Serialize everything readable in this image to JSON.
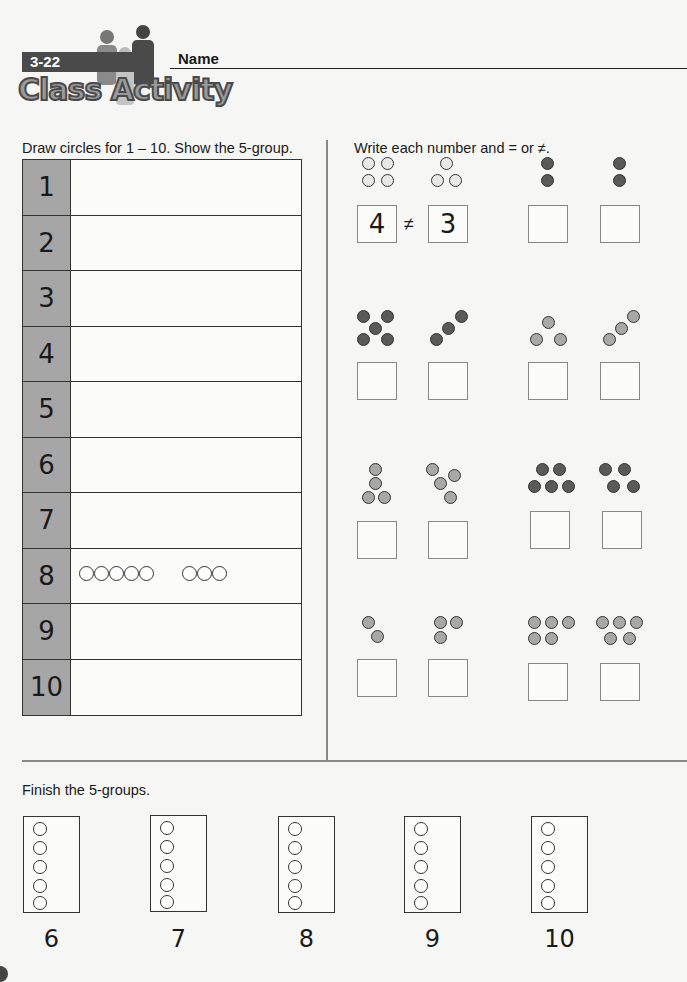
{
  "header": {
    "lesson_number": "3-22",
    "banner_title": "Class Activity",
    "name_label": "Name"
  },
  "left_section": {
    "instruction": "Draw circles for 1 – 10. Show the 5-group.",
    "rows": [
      {
        "number": "1",
        "circles_first": 0,
        "circles_second": 0
      },
      {
        "number": "2",
        "circles_first": 0,
        "circles_second": 0
      },
      {
        "number": "3",
        "circles_first": 0,
        "circles_second": 0
      },
      {
        "number": "4",
        "circles_first": 0,
        "circles_second": 0
      },
      {
        "number": "5",
        "circles_first": 0,
        "circles_second": 0
      },
      {
        "number": "6",
        "circles_first": 0,
        "circles_second": 0
      },
      {
        "number": "7",
        "circles_first": 0,
        "circles_second": 0
      },
      {
        "number": "8",
        "circles_first": 5,
        "circles_second": 3
      },
      {
        "number": "9",
        "circles_first": 0,
        "circles_second": 0
      },
      {
        "number": "10",
        "circles_first": 0,
        "circles_second": 0
      }
    ]
  },
  "right_section": {
    "instruction": "Write each number and = or ≠.",
    "problems": [
      {
        "left_count": 4,
        "right_count": 3,
        "dot_color": "white",
        "left_answer": "4",
        "sign": "≠",
        "right_answer": "3"
      },
      {
        "left_count": 2,
        "right_count": 2,
        "dot_color": "dark",
        "left_answer": "",
        "sign": "",
        "right_answer": ""
      },
      {
        "left_count": 5,
        "right_count": 3,
        "dot_color": "dark",
        "left_answer": "",
        "sign": "",
        "right_answer": ""
      },
      {
        "left_count": 3,
        "right_count": 3,
        "dot_color": "gray",
        "left_answer": "",
        "sign": "",
        "right_answer": ""
      },
      {
        "left_count": 4,
        "right_count": 4,
        "dot_color": "gray",
        "left_answer": "",
        "sign": "",
        "right_answer": ""
      },
      {
        "left_count": 5,
        "right_count": 4,
        "dot_color": "dark",
        "left_answer": "",
        "sign": "",
        "right_answer": ""
      },
      {
        "left_count": 2,
        "right_count": 3,
        "dot_color": "gray",
        "left_answer": "",
        "sign": "",
        "right_answer": ""
      },
      {
        "left_count": 5,
        "right_count": 5,
        "dot_color": "gray",
        "left_answer": "",
        "sign": "",
        "right_answer": ""
      }
    ]
  },
  "bottom_section": {
    "instruction": "Finish the 5-groups.",
    "groups": [
      {
        "label": "6"
      },
      {
        "label": "7"
      },
      {
        "label": "8"
      },
      {
        "label": "9"
      },
      {
        "label": "10"
      }
    ]
  },
  "colors": {
    "dark_dot": "#5a5a5a",
    "gray_dot": "#a8a8a8",
    "white_dot": "#e8e8e8",
    "number_column": "#a6a6a6"
  }
}
